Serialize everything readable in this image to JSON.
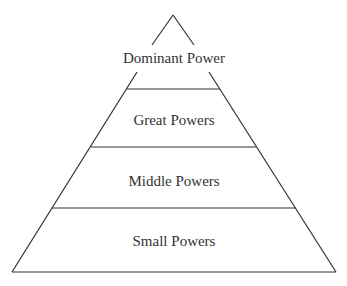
{
  "diagram": {
    "type": "pyramid",
    "levels": [
      {
        "label": "Dominant Power"
      },
      {
        "label": "Great Powers"
      },
      {
        "label": "Middle Powers"
      },
      {
        "label": "Small Powers"
      }
    ],
    "line_color": "#333333"
  }
}
